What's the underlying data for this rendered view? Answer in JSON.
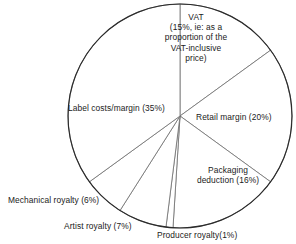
{
  "chart_data": {
    "type": "pie",
    "title": "",
    "subtitle": "",
    "xlabel": "",
    "ylabel": "",
    "legend_position": "none",
    "grid": false,
    "start_angle_deg": 0,
    "direction": "clockwise",
    "units": "percent",
    "categories": [
      "VAT",
      "Retail margin",
      "Packaging deduction",
      "Producer royalty",
      "Artist royalty",
      "Mechanical royalty",
      "Label costs/margin"
    ],
    "values": [
      15,
      20,
      16,
      1,
      7,
      6,
      35
    ],
    "labels": [
      "VAT (15%, ie: as a proportion of the VAT-inclusive price)",
      "Retail margin (20%)",
      "Packaging deduction (16%)",
      "Producer royalty(1%)",
      "Artist royalty (7%)",
      "Mechanical royalty (6%)",
      "Label costs/margin (35%)"
    ],
    "slices": [
      {
        "name": "VAT",
        "value": 15,
        "label_lines": [
          "VAT",
          "(15%, ie: as a",
          "proportion of the",
          "VAT-inclusive",
          "price)"
        ]
      },
      {
        "name": "Retail margin",
        "value": 20,
        "label_lines": [
          "Retail margin (20%)"
        ]
      },
      {
        "name": "Packaging deduction",
        "value": 16,
        "label_lines": [
          "Packaging",
          "deduction (16%)"
        ]
      },
      {
        "name": "Producer royalty",
        "value": 1,
        "label_lines": [
          "Producer royalty(1%)"
        ]
      },
      {
        "name": "Artist royalty",
        "value": 7,
        "label_lines": [
          "Artist royalty (7%)"
        ]
      },
      {
        "name": "Mechanical royalty",
        "value": 6,
        "label_lines": [
          "Mechanical royalty (6%)"
        ]
      },
      {
        "name": "Label costs/margin",
        "value": 35,
        "label_lines": [
          "Label costs/margin (35%)"
        ]
      }
    ]
  },
  "labels": {
    "vat_line1": "VAT",
    "vat_line2": "(15%, ie: as a",
    "vat_line3": "proportion of the",
    "vat_line4": "VAT-inclusive",
    "vat_line5": "price)",
    "retail": "Retail margin (20%)",
    "packaging_line1": "Packaging",
    "packaging_line2": "deduction (16%)",
    "producer": "Producer royalty(1%)",
    "artist": "Artist royalty (7%)",
    "mechanical": "Mechanical royalty (6%)",
    "label_costs": "Label costs/margin (35%)"
  },
  "colors": {
    "slice_fill": "#ffffff",
    "slice_stroke": "#6e6e6e",
    "outline": "#2b2b2b",
    "text": "#1b1b1b",
    "background": "#ffffff"
  },
  "geometry": {
    "center_x": 180,
    "center_y": 116,
    "radius": 112
  }
}
